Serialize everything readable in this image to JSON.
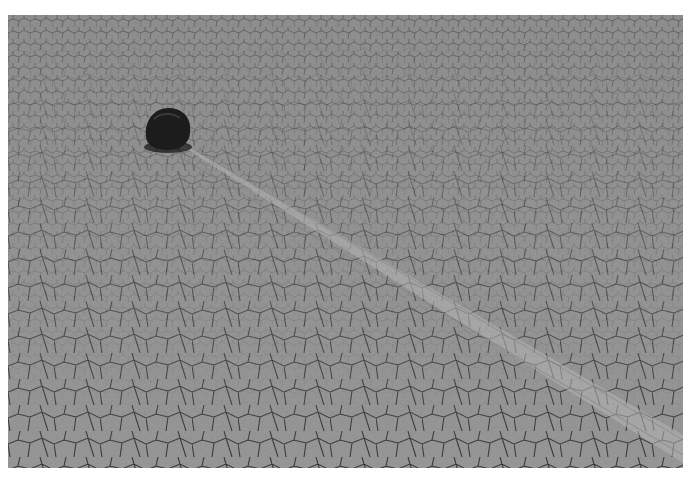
{
  "image": {
    "subject": "sailing stone on cracked dry lakebed",
    "alt": "A dark rock sits on a cracked mud playa with a long straight track trailing from it toward the lower right",
    "colors": {
      "background": "#ffffff",
      "ground": "#8e8e8e",
      "ground_light": "#a6a6a6",
      "cracks": "#3a3a3a",
      "rock": "#1c1c1c",
      "trail": "#b0b0b0"
    }
  }
}
